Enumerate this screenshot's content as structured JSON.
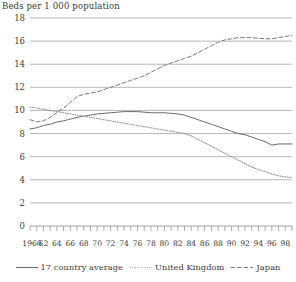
{
  "axis_title": "Beds per 1 000 population",
  "legend": {
    "items": [
      {
        "label": "17 country average",
        "style": "solid",
        "color": "#6b6b6b"
      },
      {
        "label": "United Kingdom",
        "style": "dotted",
        "color": "#8e8e8e"
      },
      {
        "label": "Japan",
        "style": "dashed",
        "color": "#7a7a7a"
      }
    ]
  },
  "chart_data": {
    "type": "line",
    "title": "Beds per 1 000 population",
    "xlabel": "",
    "ylabel": "Beds per 1 000 population",
    "xlim": [
      1960,
      1999
    ],
    "ylim": [
      0,
      18
    ],
    "ytick_step": 2,
    "yticks": [
      0,
      2,
      4,
      6,
      8,
      10,
      12,
      14,
      16,
      18
    ],
    "grid": "horizontal",
    "legend_position": "bottom-center",
    "x": [
      1960,
      1961,
      1962,
      1963,
      1964,
      1965,
      1966,
      1967,
      1968,
      1969,
      1970,
      1971,
      1972,
      1973,
      1974,
      1975,
      1976,
      1977,
      1978,
      1979,
      1980,
      1981,
      1982,
      1983,
      1984,
      1985,
      1986,
      1987,
      1988,
      1989,
      1990,
      1991,
      1992,
      1993,
      1994,
      1995,
      1996,
      1997,
      1998,
      1999
    ],
    "xtick_labels": [
      "1960",
      "62",
      "64",
      "66",
      "68",
      "70",
      "72",
      "74",
      "76",
      "78",
      "80",
      "82",
      "84",
      "86",
      "88",
      "90",
      "92",
      "94",
      "96",
      "98"
    ],
    "series": [
      {
        "name": "17 country average",
        "style": "solid",
        "values": [
          8.4,
          8.5,
          8.7,
          8.8,
          9.0,
          9.1,
          9.25,
          9.4,
          9.5,
          9.6,
          9.7,
          9.75,
          9.8,
          9.85,
          9.9,
          9.9,
          9.9,
          9.85,
          9.8,
          9.8,
          9.8,
          9.75,
          9.7,
          9.6,
          9.4,
          9.2,
          9.0,
          8.8,
          8.6,
          8.4,
          8.2,
          8.0,
          7.9,
          7.7,
          7.5,
          7.3,
          7.0,
          7.1,
          7.1,
          7.1
        ]
      },
      {
        "name": "United Kingdom",
        "style": "dotted",
        "values": [
          10.3,
          10.2,
          10.1,
          10.0,
          9.9,
          9.8,
          9.7,
          9.6,
          9.5,
          9.4,
          9.3,
          9.2,
          9.1,
          9.0,
          8.9,
          8.8,
          8.7,
          8.6,
          8.5,
          8.4,
          8.3,
          8.2,
          8.1,
          8.0,
          7.8,
          7.5,
          7.2,
          6.9,
          6.6,
          6.3,
          6.0,
          5.7,
          5.4,
          5.1,
          4.9,
          4.7,
          4.5,
          4.35,
          4.25,
          4.2
        ]
      },
      {
        "name": "Japan",
        "style": "dashed",
        "values": [
          9.2,
          9.0,
          9.1,
          9.4,
          9.8,
          10.2,
          10.7,
          11.2,
          11.4,
          11.5,
          11.6,
          11.8,
          12.0,
          12.2,
          12.4,
          12.6,
          12.8,
          13.0,
          13.3,
          13.6,
          13.9,
          14.1,
          14.3,
          14.5,
          14.7,
          15.0,
          15.3,
          15.6,
          15.9,
          16.1,
          16.2,
          16.3,
          16.3,
          16.3,
          16.25,
          16.2,
          16.2,
          16.3,
          16.4,
          16.5
        ]
      }
    ]
  }
}
